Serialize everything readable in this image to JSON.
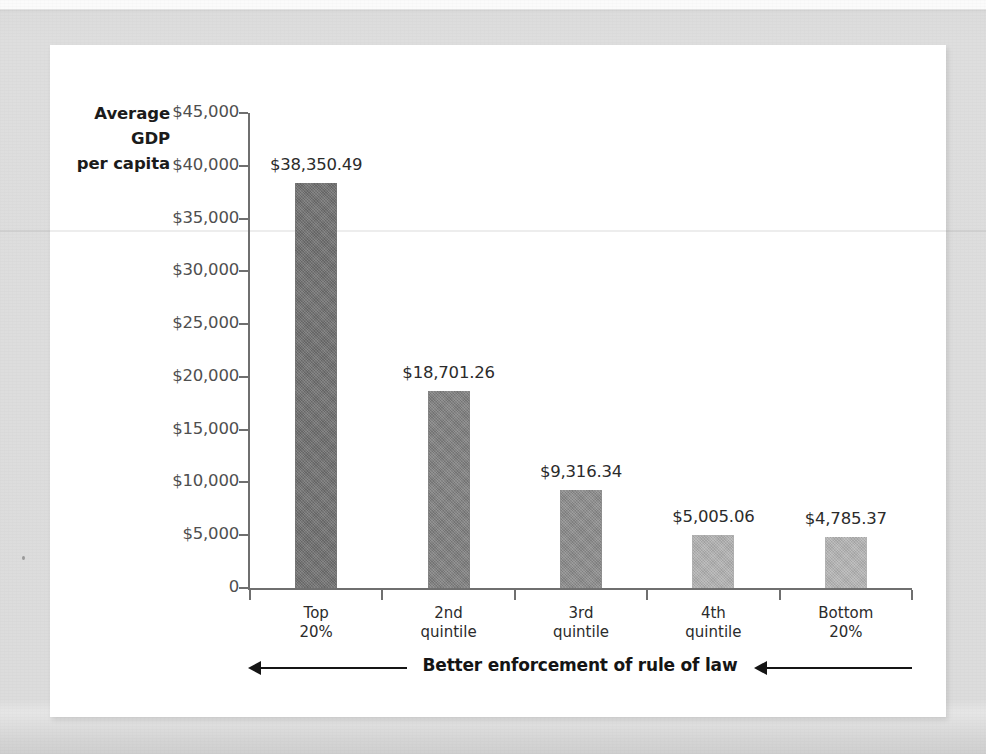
{
  "chart_data": {
    "type": "bar",
    "title": "",
    "subtitle": "",
    "xlabel": "Better enforcement of rule of law",
    "ylabel": "Average GDP per capita",
    "ylabel_lines": [
      "Average",
      "GDP",
      "per capita"
    ],
    "categories": [
      "Top 20%",
      "2nd quintile",
      "3rd quintile",
      "4th quintile",
      "Bottom 20%"
    ],
    "category_lines": [
      [
        "Top",
        "20%"
      ],
      [
        "2nd",
        "quintile"
      ],
      [
        "3rd",
        "quintile"
      ],
      [
        "4th",
        "quintile"
      ],
      [
        "Bottom",
        "20%"
      ]
    ],
    "values": [
      38350.49,
      18701.26,
      9316.34,
      5005.06,
      4785.37
    ],
    "value_labels": [
      "$38,350.49",
      "$18,701.26",
      "$9,316.34",
      "$5,005.06",
      "$4,785.37"
    ],
    "bar_colors": [
      "#6e6e6e",
      "#7e7e7e",
      "#8a8a8a",
      "#b1b1b1",
      "#b4b4b4"
    ],
    "ylim": [
      0,
      45000
    ],
    "ytick_values": [
      45000,
      40000,
      35000,
      30000,
      25000,
      20000,
      15000,
      10000,
      5000,
      0
    ],
    "ytick_labels": [
      "$45,000",
      "$40,000",
      "$35,000",
      "$30,000",
      "$25,000",
      "$20,000",
      "$15,000",
      "$10,000",
      "$5,000",
      "0"
    ],
    "grid": false,
    "legend": "none",
    "annotations": [
      {
        "name": "left-arrow",
        "direction": "left"
      },
      {
        "name": "right-arrow",
        "direction": "left"
      }
    ]
  },
  "colors": {
    "page_background": "#dcdcdc",
    "card_background": "#ffffff",
    "axis": "#6f6f6f",
    "text": "#2b2b2b",
    "tick_text": "#4f4f4f",
    "annotation_text": "#151515"
  }
}
